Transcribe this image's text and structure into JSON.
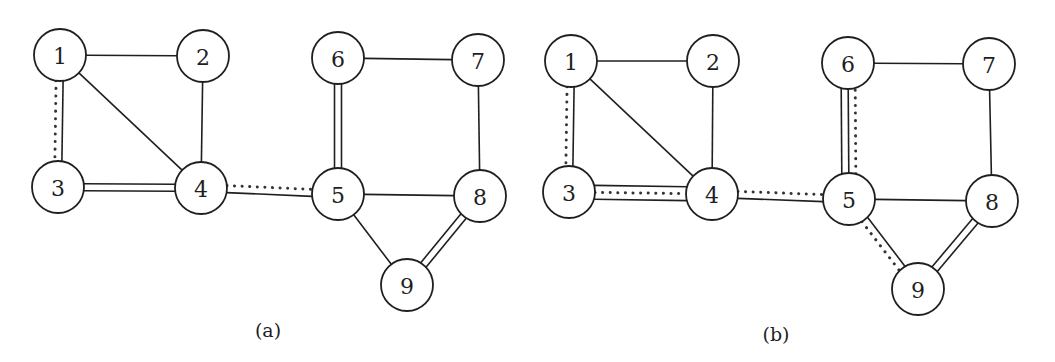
{
  "diagram": {
    "node_radius": 26,
    "colors": {
      "stroke": "#1f1f1f",
      "background": "#ffffff"
    },
    "panels": [
      {
        "id": "a",
        "label": "(a)",
        "label_pos": [
          268,
          337
        ],
        "nodes": [
          {
            "id": "1",
            "label": "1",
            "x": 60,
            "y": 55
          },
          {
            "id": "2",
            "label": "2",
            "x": 203,
            "y": 56
          },
          {
            "id": "3",
            "label": "3",
            "x": 58,
            "y": 187
          },
          {
            "id": "4",
            "label": "4",
            "x": 201,
            "y": 188
          },
          {
            "id": "5",
            "label": "5",
            "x": 338,
            "y": 194
          },
          {
            "id": "6",
            "label": "6",
            "x": 338,
            "y": 58
          },
          {
            "id": "7",
            "label": "7",
            "x": 478,
            "y": 60
          },
          {
            "id": "8",
            "label": "8",
            "x": 480,
            "y": 196
          },
          {
            "id": "9",
            "label": "9",
            "x": 407,
            "y": 285
          }
        ],
        "edges": [
          {
            "from": "1",
            "to": "2",
            "style": [
              "solid"
            ]
          },
          {
            "from": "1",
            "to": "3",
            "style": [
              "solid",
              "dotted"
            ]
          },
          {
            "from": "1",
            "to": "4",
            "style": [
              "solid"
            ]
          },
          {
            "from": "2",
            "to": "4",
            "style": [
              "solid"
            ]
          },
          {
            "from": "3",
            "to": "4",
            "style": [
              "solid",
              "solid"
            ]
          },
          {
            "from": "4",
            "to": "5",
            "style": [
              "dotted",
              "solid"
            ]
          },
          {
            "from": "5",
            "to": "6",
            "style": [
              "solid",
              "solid"
            ]
          },
          {
            "from": "6",
            "to": "7",
            "style": [
              "solid"
            ]
          },
          {
            "from": "7",
            "to": "8",
            "style": [
              "solid"
            ]
          },
          {
            "from": "5",
            "to": "8",
            "style": [
              "solid"
            ]
          },
          {
            "from": "5",
            "to": "9",
            "style": [
              "solid"
            ]
          },
          {
            "from": "8",
            "to": "9",
            "style": [
              "solid",
              "solid"
            ]
          }
        ]
      },
      {
        "id": "b",
        "label": "(b)",
        "label_pos": [
          776,
          341
        ],
        "nodes": [
          {
            "id": "1",
            "label": "1",
            "x": 571,
            "y": 61
          },
          {
            "id": "2",
            "label": "2",
            "x": 713,
            "y": 61
          },
          {
            "id": "3",
            "label": "3",
            "x": 569,
            "y": 192
          },
          {
            "id": "4",
            "label": "4",
            "x": 712,
            "y": 194
          },
          {
            "id": "5",
            "label": "5",
            "x": 849,
            "y": 199
          },
          {
            "id": "6",
            "label": "6",
            "x": 848,
            "y": 63
          },
          {
            "id": "7",
            "label": "7",
            "x": 989,
            "y": 64
          },
          {
            "id": "8",
            "label": "8",
            "x": 992,
            "y": 201
          },
          {
            "id": "9",
            "label": "9",
            "x": 918,
            "y": 289
          }
        ],
        "edges": [
          {
            "from": "1",
            "to": "2",
            "style": [
              "solid"
            ]
          },
          {
            "from": "1",
            "to": "3",
            "style": [
              "solid",
              "dotted"
            ]
          },
          {
            "from": "1",
            "to": "4",
            "style": [
              "solid"
            ]
          },
          {
            "from": "2",
            "to": "4",
            "style": [
              "solid"
            ]
          },
          {
            "from": "3",
            "to": "4",
            "style": [
              "solid",
              "dotted",
              "solid"
            ]
          },
          {
            "from": "4",
            "to": "5",
            "style": [
              "dotted",
              "solid"
            ]
          },
          {
            "from": "5",
            "to": "6",
            "style": [
              "solid",
              "solid",
              "dotted"
            ]
          },
          {
            "from": "6",
            "to": "7",
            "style": [
              "solid"
            ]
          },
          {
            "from": "7",
            "to": "8",
            "style": [
              "solid"
            ]
          },
          {
            "from": "5",
            "to": "8",
            "style": [
              "solid"
            ]
          },
          {
            "from": "5",
            "to": "9",
            "style": [
              "solid",
              "dotted"
            ]
          },
          {
            "from": "8",
            "to": "9",
            "style": [
              "solid",
              "solid"
            ]
          }
        ]
      }
    ]
  }
}
